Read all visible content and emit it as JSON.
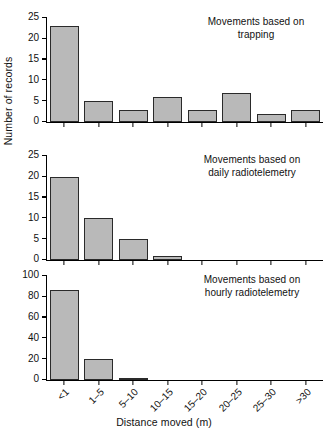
{
  "chart_data": {
    "type": "bar",
    "title": "",
    "xlabel": "Distance moved (m)",
    "ylabel": "Number of records",
    "categories": [
      "<1",
      "1–5",
      "5–10",
      "10–15",
      "15–20",
      "20–25",
      "25–30",
      ">30"
    ],
    "grid": false,
    "legend": "none",
    "panels": [
      {
        "annotation": "Movements based on\ntrapping",
        "values": [
          23,
          5,
          3,
          6,
          3,
          7,
          2,
          3
        ],
        "ylim": [
          0,
          25
        ],
        "yticks": [
          0,
          5,
          10,
          15,
          20,
          25
        ],
        "ytick_labels": [
          "0",
          "5",
          "10",
          "15",
          "20",
          "25"
        ]
      },
      {
        "annotation": "Movements based on\ndaily radiotelemetry",
        "values": [
          20,
          10,
          5,
          1,
          0,
          0,
          0,
          0
        ],
        "ylim": [
          0,
          25
        ],
        "yticks": [
          0,
          5,
          10,
          15,
          20,
          25
        ],
        "ytick_labels": [
          "0",
          "5",
          "10",
          "15",
          "20",
          "25"
        ]
      },
      {
        "annotation": "Movements based on\nhourly radiotelemetry",
        "values": [
          87,
          20,
          2,
          0,
          0,
          0,
          0,
          0
        ],
        "ylim": [
          0,
          100
        ],
        "yticks": [
          0,
          20,
          40,
          60,
          80,
          100
        ],
        "ytick_labels": [
          "0",
          "20",
          "40",
          "60",
          "80",
          "100"
        ]
      }
    ],
    "colors": {
      "bar_fill": "#b9b9b9",
      "bar_edge": "#2a2a2a",
      "axis": "#000000",
      "text": "#111111",
      "background": "#ffffff"
    }
  }
}
